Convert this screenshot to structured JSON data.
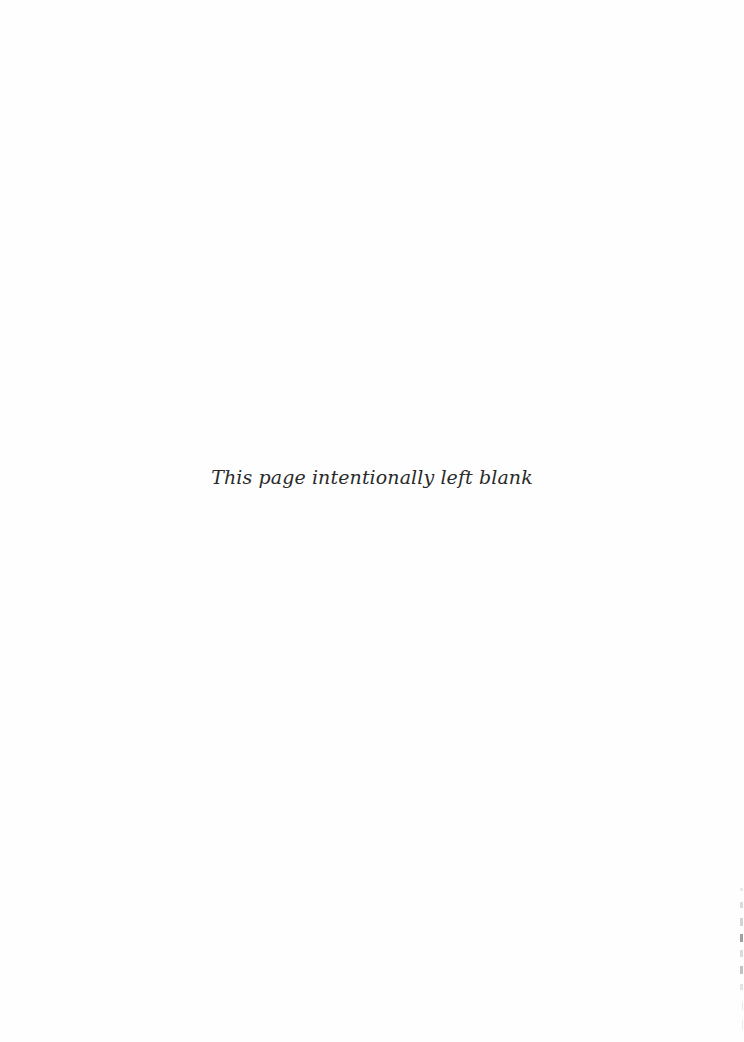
{
  "page": {
    "background": "#fefefe",
    "notice_text": "This page intentionally left blank"
  }
}
